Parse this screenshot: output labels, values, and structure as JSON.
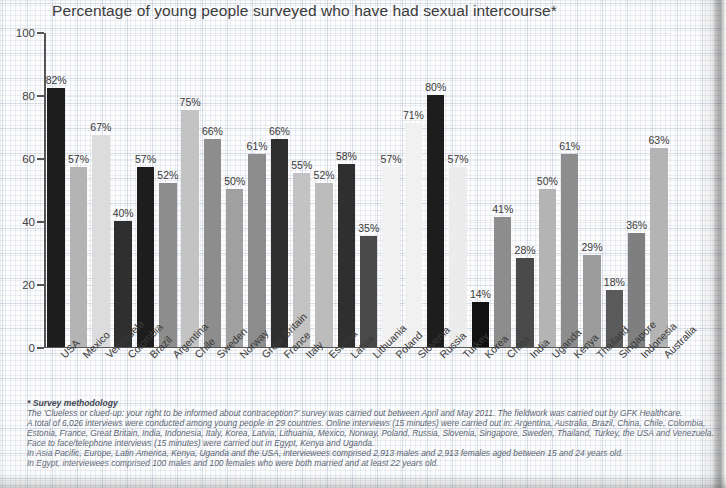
{
  "chart_data": {
    "type": "bar",
    "title": "Percentage of young people surveyed who have had sexual intercourse*",
    "xlabel": "",
    "ylabel": "",
    "ylim": [
      0,
      100
    ],
    "yticks": [
      0,
      20,
      40,
      60,
      80,
      100
    ],
    "grid": true,
    "legend": "none",
    "value_suffix": "%",
    "categories": [
      "USA",
      "Mexico",
      "Venezuela",
      "Colombia",
      "Brazil",
      "Argentina",
      "Chile",
      "Sweden",
      "Norway",
      "Great Britain",
      "France",
      "Italy",
      "Estonia",
      "Latvia",
      "Lithuania",
      "Poland",
      "Slovenia",
      "Russia",
      "Turkey",
      "Korea",
      "China",
      "India",
      "Uganda",
      "Kenya",
      "Thailand",
      "Singapore",
      "Indonesia",
      "Australia"
    ],
    "values": [
      82,
      57,
      67,
      40,
      57,
      52,
      75,
      66,
      50,
      61,
      66,
      55,
      52,
      58,
      35,
      57,
      71,
      80,
      57,
      14,
      41,
      28,
      50,
      61,
      29,
      18,
      36,
      63
    ],
    "labels": [
      "82%",
      "57%",
      "67%",
      "40%",
      "57%",
      "52%",
      "75%",
      "66%",
      "50%",
      "61%",
      "66%",
      "55%",
      "52%",
      "58%",
      "35%",
      "57%",
      "71%",
      "80%",
      "57%",
      "14%",
      "41%",
      "28%",
      "50%",
      "61%",
      "29%",
      "18%",
      "36%",
      "63%"
    ],
    "bar_colors": [
      "#1d1d1d",
      "#b4b4b4",
      "#dcdcdc",
      "#2f2f2f",
      "#1d1d1d",
      "#8d8d8d",
      "#c3c3c3",
      "#8d8d8d",
      "#a0a0a0",
      "#8d8d8d",
      "#2f2f2f",
      "#c3c3c3",
      "#bcbcbc",
      "#2f2f2f",
      "#4a4a4a",
      "#f1f1f1",
      "#f1f1f1",
      "#1d1d1d",
      "#ececec",
      "#111111",
      "#8d8d8d",
      "#4a4a4a",
      "#b4b4b4",
      "#8d8d8d",
      "#9b9b9b",
      "#5a5a5a",
      "#7f7f7f",
      "#b4b4b4"
    ]
  },
  "footnote": {
    "title": "* Survey methodology",
    "lines": [
      "The 'Clueless or clued-up: your right to be informed about contraception?' survey was carried out between April and May 2011. The fieldwork was carried out by GFK Healthcare.",
      "A total of 6,026 interviews were conducted among young people in 29 countries. Online interviews (15 minutes) were carried out in: Argentina, Australia, Brazil, China, Chile, Colombia,",
      "Estonia, France, Great Britain, India, Indonesia, Italy, Korea, Latvia, Lithuania, Mexico, Norway, Poland, Russia, Slovenia, Singapore, Sweden, Thailand, Turkey, the USA and Venezuela.",
      "Face to face/telephone interviews (15 minutes) were carried out in Egypt, Kenya and Uganda.",
      "In Asia Pacific, Europe, Latin America, Kenya, Uganda and the USA, interviewees comprised 2,913 males and 2,913 females aged between 15 and 24 years old.",
      "In Egypt, interviewees comprised 100 males and 100 females who were both married and at least 22 years old."
    ]
  }
}
